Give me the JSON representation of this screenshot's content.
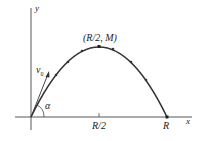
{
  "diagram": {
    "type": "projectile-trajectory",
    "labels": {
      "y_axis": "y",
      "x_axis": "x",
      "apex": "(R/2, M)",
      "half_range": "R/2",
      "range": "R",
      "velocity": "v",
      "velocity_sub": "0",
      "angle": "α"
    },
    "colors": {
      "axis": "#444444",
      "curve": "#333333",
      "text": "#222222"
    }
  }
}
